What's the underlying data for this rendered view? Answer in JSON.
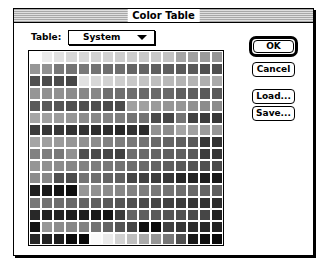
{
  "window": {
    "title": "Color Table"
  },
  "table_selector": {
    "label": "Table:",
    "selected": "System",
    "icon": "triangle-down-icon"
  },
  "buttons": {
    "ok": "OK",
    "cancel": "Cancel",
    "load": "Load...",
    "save": "Save..."
  },
  "colors": {
    "window_border": "#000000",
    "background": "#ffffff"
  },
  "color_grid": {
    "columns": 16,
    "rows": 16,
    "gray_values": [
      [
        255,
        235,
        225,
        215,
        215,
        210,
        210,
        205,
        205,
        200,
        200,
        195,
        165,
        160,
        155,
        150
      ],
      [
        150,
        145,
        120,
        115,
        120,
        115,
        110,
        110,
        100,
        100,
        95,
        95,
        90,
        90,
        80,
        80
      ],
      [
        80,
        75,
        75,
        70,
        225,
        215,
        210,
        205,
        200,
        195,
        190,
        185,
        180,
        180,
        175,
        170
      ],
      [
        150,
        145,
        145,
        140,
        135,
        135,
        110,
        110,
        110,
        105,
        105,
        105,
        95,
        95,
        90,
        90
      ],
      [
        90,
        90,
        85,
        80,
        80,
        80,
        75,
        75,
        160,
        160,
        155,
        150,
        150,
        145,
        140,
        140
      ],
      [
        165,
        160,
        155,
        150,
        140,
        135,
        130,
        125,
        115,
        115,
        75,
        70,
        115,
        65,
        60,
        55
      ],
      [
        60,
        55,
        55,
        50,
        50,
        45,
        45,
        40,
        50,
        45,
        145,
        140,
        165,
        160,
        155,
        150
      ],
      [
        165,
        160,
        155,
        150,
        145,
        140,
        130,
        125,
        120,
        115,
        105,
        100,
        95,
        90,
        55,
        50
      ],
      [
        130,
        125,
        120,
        145,
        80,
        75,
        70,
        65,
        110,
        105,
        100,
        95,
        95,
        90,
        60,
        55
      ],
      [
        150,
        145,
        140,
        135,
        130,
        125,
        120,
        115,
        110,
        105,
        100,
        95,
        90,
        85,
        80,
        75
      ],
      [
        140,
        135,
        80,
        75,
        115,
        110,
        100,
        95,
        70,
        65,
        60,
        55,
        40,
        35,
        30,
        25
      ],
      [
        30,
        25,
        20,
        15,
        150,
        145,
        140,
        135,
        130,
        125,
        120,
        115,
        110,
        105,
        100,
        95
      ],
      [
        120,
        115,
        110,
        105,
        100,
        95,
        90,
        85,
        80,
        75,
        70,
        65,
        60,
        55,
        50,
        45
      ],
      [
        40,
        35,
        35,
        30,
        30,
        25,
        20,
        60,
        100,
        95,
        90,
        85,
        80,
        75,
        70,
        35
      ],
      [
        20,
        150,
        140,
        135,
        130,
        115,
        100,
        85,
        70,
        15,
        10,
        65,
        55,
        45,
        40,
        35
      ],
      [
        40,
        35,
        30,
        10,
        10,
        250,
        235,
        210,
        190,
        170,
        150,
        120,
        80,
        25,
        15,
        10
      ]
    ]
  }
}
